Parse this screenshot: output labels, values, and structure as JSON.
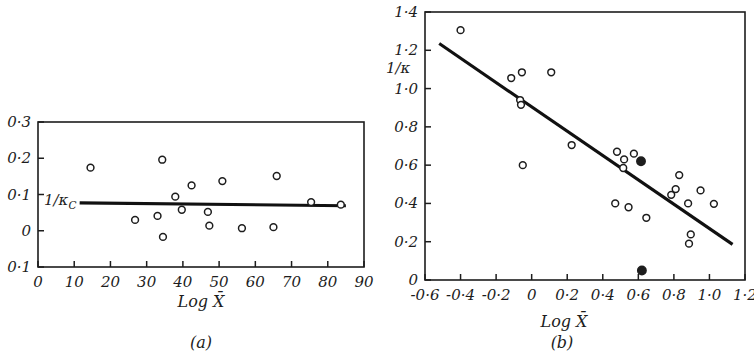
{
  "figure": {
    "title": "",
    "panels": [
      "a",
      "b"
    ]
  },
  "panel_a": {
    "caption": "(a)",
    "series_label": "1/κ",
    "series_label_sub": "C",
    "xlabel": "Log X̄"
  },
  "panel_b": {
    "caption": "(b)",
    "series_label": "1/κ",
    "xlabel": "Log X̄"
  },
  "chart_data": [
    {
      "type": "scatter",
      "panel": "a",
      "title": "(a)",
      "xlabel": "Log X̄",
      "ylabel": "1/κc",
      "xlim": [
        0,
        90
      ],
      "ylim": [
        -0.1,
        0.3
      ],
      "xticks": [
        0,
        10,
        20,
        30,
        40,
        50,
        60,
        70,
        80,
        90
      ],
      "xticklabels": [
        "0",
        "10",
        "20",
        "30",
        "40",
        "50",
        "60",
        "70",
        "80",
        "90"
      ],
      "yticks": [
        0.3,
        0.2,
        0.1,
        0.0,
        -0.1
      ],
      "yticklabels": [
        "0·3",
        "0·2",
        "0·1",
        "0",
        "0·1"
      ],
      "grid": false,
      "legend": null,
      "annotations": [
        {
          "text": "1/κc",
          "x": 3,
          "y": 0.075,
          "note": "label at left end of horizontal fitted line"
        }
      ],
      "fit_line": {
        "label": "1/κc",
        "x": [
          11.5,
          85.0
        ],
        "y": [
          0.077,
          0.069
        ],
        "style": "solid"
      },
      "points": [
        {
          "x": 14.5,
          "y": 0.174,
          "marker": "open-circle"
        },
        {
          "x": 26.8,
          "y": 0.03,
          "marker": "open-circle"
        },
        {
          "x": 33.0,
          "y": 0.041,
          "marker": "open-circle"
        },
        {
          "x": 34.3,
          "y": 0.196,
          "marker": "open-circle"
        },
        {
          "x": 34.5,
          "y": -0.017,
          "marker": "open-circle"
        },
        {
          "x": 37.9,
          "y": 0.094,
          "marker": "open-circle"
        },
        {
          "x": 39.7,
          "y": 0.058,
          "marker": "open-circle"
        },
        {
          "x": 42.4,
          "y": 0.125,
          "marker": "open-circle"
        },
        {
          "x": 46.9,
          "y": 0.052,
          "marker": "open-circle"
        },
        {
          "x": 47.3,
          "y": 0.014,
          "marker": "open-circle"
        },
        {
          "x": 50.9,
          "y": 0.137,
          "marker": "open-circle"
        },
        {
          "x": 56.3,
          "y": 0.007,
          "marker": "open-circle"
        },
        {
          "x": 65.0,
          "y": 0.01,
          "marker": "open-circle"
        },
        {
          "x": 65.9,
          "y": 0.151,
          "marker": "open-circle"
        },
        {
          "x": 75.4,
          "y": 0.079,
          "marker": "open-circle"
        },
        {
          "x": 83.6,
          "y": 0.072,
          "marker": "open-circle"
        }
      ]
    },
    {
      "type": "scatter",
      "panel": "b",
      "title": "(b)",
      "xlabel": "Log X̄",
      "ylabel": "1/κ",
      "xlim": [
        -0.6,
        1.2
      ],
      "ylim": [
        0.0,
        1.4
      ],
      "xticks": [
        -0.6,
        -0.4,
        -0.2,
        0.0,
        0.2,
        0.4,
        0.6,
        0.8,
        1.0,
        1.2
      ],
      "xticklabels": [
        "-0·6",
        "-0·4",
        "-0·2",
        "0",
        "0·2",
        "0·4",
        "0·6",
        "0·8",
        "1·0",
        "1·2"
      ],
      "yticks": [
        1.4,
        1.2,
        1.0,
        0.8,
        0.6,
        0.4,
        0.2,
        0.0
      ],
      "yticklabels": [
        "1·4",
        "1·2",
        "1·0",
        "0·8",
        "0·6",
        "0·4",
        "0·2",
        "0"
      ],
      "grid": false,
      "legend": null,
      "annotations": [
        {
          "text": "1/κ",
          "x": -0.72,
          "y": 1.08,
          "note": "y-axis label, partly clipped at left edge"
        }
      ],
      "fit_line": {
        "label": "regression",
        "x": [
          -0.52,
          1.13
        ],
        "y": [
          1.235,
          0.186
        ],
        "style": "solid"
      },
      "points": [
        {
          "x": -0.4,
          "y": 1.305,
          "marker": "open-circle"
        },
        {
          "x": -0.115,
          "y": 1.055,
          "marker": "open-circle"
        },
        {
          "x": -0.055,
          "y": 1.085,
          "marker": "open-circle"
        },
        {
          "x": -0.065,
          "y": 0.94,
          "marker": "open-circle"
        },
        {
          "x": -0.06,
          "y": 0.915,
          "marker": "open-circle"
        },
        {
          "x": -0.05,
          "y": 0.6,
          "marker": "open-circle"
        },
        {
          "x": 0.11,
          "y": 1.085,
          "marker": "open-circle"
        },
        {
          "x": 0.225,
          "y": 0.705,
          "marker": "open-circle"
        },
        {
          "x": 0.48,
          "y": 0.67,
          "marker": "open-circle"
        },
        {
          "x": 0.47,
          "y": 0.4,
          "marker": "open-circle"
        },
        {
          "x": 0.52,
          "y": 0.63,
          "marker": "open-circle"
        },
        {
          "x": 0.515,
          "y": 0.585,
          "marker": "open-circle"
        },
        {
          "x": 0.545,
          "y": 0.38,
          "marker": "open-circle"
        },
        {
          "x": 0.575,
          "y": 0.66,
          "marker": "open-circle"
        },
        {
          "x": 0.615,
          "y": 0.62,
          "marker": "filled-circle"
        },
        {
          "x": 0.62,
          "y": 0.05,
          "marker": "filled-circle"
        },
        {
          "x": 0.645,
          "y": 0.325,
          "marker": "open-circle"
        },
        {
          "x": 0.785,
          "y": 0.445,
          "marker": "open-circle"
        },
        {
          "x": 0.81,
          "y": 0.475,
          "marker": "open-circle"
        },
        {
          "x": 0.83,
          "y": 0.548,
          "marker": "open-circle"
        },
        {
          "x": 0.88,
          "y": 0.4,
          "marker": "open-circle"
        },
        {
          "x": 0.895,
          "y": 0.238,
          "marker": "open-circle"
        },
        {
          "x": 0.885,
          "y": 0.19,
          "marker": "open-circle"
        },
        {
          "x": 0.95,
          "y": 0.468,
          "marker": "open-circle"
        },
        {
          "x": 1.025,
          "y": 0.398,
          "marker": "open-circle"
        }
      ]
    }
  ]
}
